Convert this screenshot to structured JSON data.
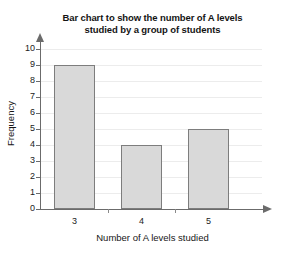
{
  "chart_data": {
    "type": "bar",
    "title": "Bar chart to show the number of A levels studied by a group of students",
    "title_lines": [
      "Bar chart to show the number of A levels",
      "studied by a group of students"
    ],
    "categories": [
      "3",
      "4",
      "5"
    ],
    "values": [
      9,
      4,
      5
    ],
    "xlabel": "Number of A levels studied",
    "ylabel": "Frequency",
    "ylim": [
      0,
      10
    ],
    "y_ticks": [
      "0",
      "1",
      "2",
      "3",
      "4",
      "5",
      "6",
      "7",
      "8",
      "9",
      "10"
    ],
    "grid": true,
    "legend": null,
    "bar_color": "#d9d9d9",
    "bar_border_color": "#7d7d7d",
    "axis_color": "#6b6b6b",
    "grid_color": "#ececec",
    "background": "#ffffff"
  }
}
